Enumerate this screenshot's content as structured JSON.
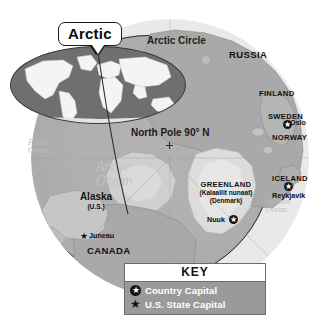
{
  "map": {
    "title_callout": "Arctic",
    "arctic_circle_label": "Arctic Circle",
    "pole_label": "North Pole 90° N",
    "oceans": {
      "arctic_line1": "Arctic",
      "arctic_line2": "Ocean",
      "pacific_line1": "Pacific",
      "pacific_line2": "Ocean",
      "atlantic_line1": "Atlantic",
      "atlantic_line2": "Ocean"
    },
    "countries": {
      "russia": "RUSSIA",
      "finland": "FINLAND",
      "sweden": "SWEDEN",
      "norway": "NORWAY",
      "iceland": "ICELAND",
      "canada": "CANADA",
      "greenland": "GREENLAND",
      "greenland_native": "(Kalaallit nunaat)",
      "greenland_owner": "(Denmark)",
      "alaska": "Alaska",
      "alaska_owner": "(U.S.)"
    },
    "cities": {
      "oslo": "Oslo",
      "reykjavik": "Reykjavik",
      "nuuk": "Nuuk",
      "juneau": "Juneau"
    }
  },
  "key": {
    "title": "KEY",
    "entries": [
      {
        "label": "Country Capital",
        "icon": "circled-star-icon"
      },
      {
        "label": "U.S. State Capital",
        "icon": "star-icon"
      }
    ]
  },
  "colors": {
    "ocean": "#b0b0b0",
    "land": "#a9a9a9",
    "ice": "#dcdcdc",
    "outer_ring": "#e9e9e9",
    "key_body": "#9a9a9a",
    "background": "#ffffff"
  }
}
